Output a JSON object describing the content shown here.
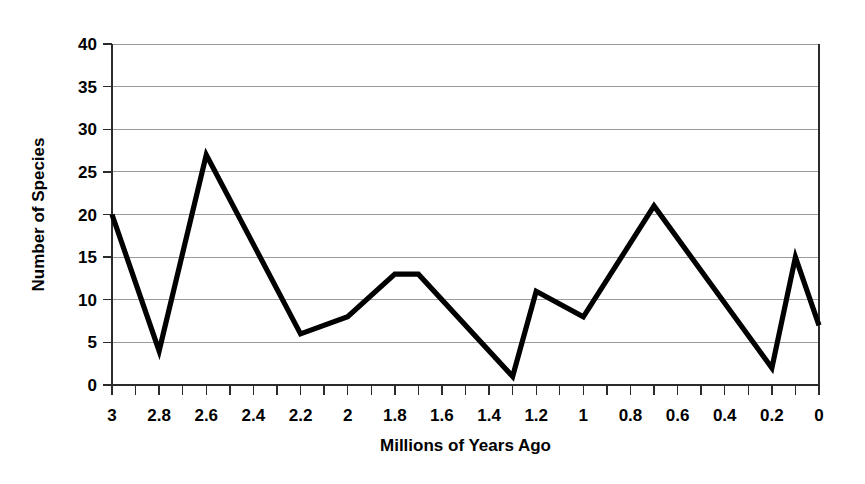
{
  "chart_data": {
    "type": "line",
    "title": "",
    "xlabel": "Millions of Years Ago",
    "ylabel": "Number of Species",
    "xlim": [
      3.0,
      0.0
    ],
    "ylim": [
      0,
      40
    ],
    "x_tick_step": 0.2,
    "x_minor_tick_step": 0.1,
    "y_tick_step": 5,
    "x_axis_reversed": true,
    "grid": "horizontal",
    "legend": "none",
    "line_color": "#000000",
    "x_tick_labels": [
      "3",
      "2.8",
      "2.6",
      "2.4",
      "2.2",
      "2",
      "1.8",
      "1.6",
      "1.4",
      "1.2",
      "1",
      "0.8",
      "0.6",
      "0.4",
      "0.2",
      "0"
    ],
    "y_tick_labels": [
      "0",
      "5",
      "10",
      "15",
      "20",
      "25",
      "30",
      "35",
      "40"
    ],
    "series": [
      {
        "name": "Number of Species",
        "x": [
          3.0,
          2.8,
          2.6,
          2.2,
          2.0,
          1.8,
          1.7,
          1.3,
          1.2,
          1.0,
          0.7,
          0.2,
          0.1,
          0.0
        ],
        "values": [
          20,
          4,
          27,
          6,
          8,
          13,
          13,
          1,
          11,
          8,
          21,
          2,
          15,
          7
        ]
      }
    ]
  }
}
